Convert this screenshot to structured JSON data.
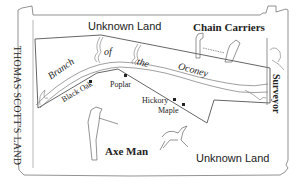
{
  "map": {
    "title_left": "THOMAS SCOTT'S LAND",
    "top_region": "Unknown Land",
    "bottom_region": "Unknown Land",
    "river_words": [
      "Branch",
      "of",
      "the",
      "Oconey"
    ],
    "figures": {
      "chain_carriers": "Chain Carriers",
      "surveyor": "Surveyor",
      "axe_man": "Axe Man"
    },
    "trees": [
      "Black Oak",
      "Poplar",
      "Hickory",
      "Maple"
    ],
    "colors": {
      "line": "#555555",
      "text": "#222222",
      "paper": "#ffffff"
    }
  }
}
